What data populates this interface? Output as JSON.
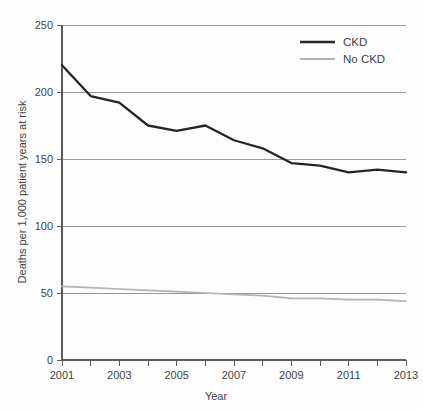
{
  "chart_data": {
    "type": "line",
    "title": "",
    "xlabel": "Year",
    "ylabel": "Deaths per 1,000 patient years at risk",
    "x": [
      2001,
      2002,
      2003,
      2004,
      2005,
      2006,
      2007,
      2008,
      2009,
      2010,
      2011,
      2012,
      2013
    ],
    "xlim": [
      2001,
      2013
    ],
    "ylim": [
      0,
      250
    ],
    "yticks": [
      0,
      50,
      100,
      150,
      200,
      250
    ],
    "xticks": [
      2001,
      2002,
      2003,
      2004,
      2005,
      2006,
      2007,
      2008,
      2009,
      2010,
      2011,
      2012,
      2013
    ],
    "xtick_labels_shown": [
      "2001",
      "2003",
      "2005",
      "2007",
      "2009",
      "2011",
      "2013"
    ],
    "ytick_labels": [
      "0",
      "50",
      "100",
      "150",
      "200",
      "250"
    ],
    "grid": "horizontal",
    "legend_position": "top-right",
    "series": [
      {
        "name": "CKD",
        "color": "#262626",
        "values": [
          220,
          197,
          192,
          175,
          171,
          175,
          164,
          158,
          147,
          145,
          140,
          142,
          140
        ]
      },
      {
        "name": "No CKD",
        "color": "#b3b3b3",
        "values": [
          55,
          54,
          53,
          52,
          51,
          50,
          49,
          48,
          46,
          46,
          45,
          45,
          44
        ]
      }
    ]
  },
  "axes": {
    "y_title": "Deaths per 1,000 patient years at risk",
    "x_title": "Year",
    "y_ticks": [
      {
        "label": "250",
        "value": 250
      },
      {
        "label": "200",
        "value": 200
      },
      {
        "label": "150",
        "value": 150
      },
      {
        "label": "100",
        "value": 100
      },
      {
        "label": "50",
        "value": 50
      },
      {
        "label": "0",
        "value": 0
      }
    ],
    "x_ticks": [
      {
        "label": "2001",
        "value": 2001
      },
      {
        "label": "2003",
        "value": 2003
      },
      {
        "label": "2005",
        "value": 2005
      },
      {
        "label": "2007",
        "value": 2007
      },
      {
        "label": "2009",
        "value": 2009
      },
      {
        "label": "2011",
        "value": 2011
      },
      {
        "label": "2013",
        "value": 2013
      }
    ]
  },
  "legend": {
    "entries": [
      {
        "label": "CKD",
        "color": "#262626"
      },
      {
        "label": "No CKD",
        "color": "#b3b3b3"
      }
    ]
  }
}
